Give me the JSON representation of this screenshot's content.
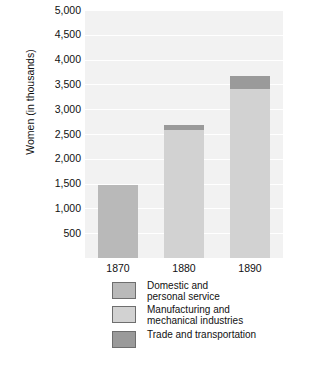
{
  "chart_data": {
    "type": "bar",
    "subtype": "stacked-vertical",
    "title": "",
    "xlabel": "",
    "ylabel": "Women (in thousands)",
    "categories": [
      "1870",
      "1880",
      "1890"
    ],
    "series": [
      {
        "name": "Domestic and\npersonal service",
        "color": "#b9b9b9",
        "values": [
          1480,
          0,
          0
        ]
      },
      {
        "name": "Manufacturing and\nmechanical industries",
        "color": "#d2d2d2",
        "values": [
          0,
          2590,
          3400
        ]
      },
      {
        "name": "Trade and transportation",
        "color": "#9a9a9a",
        "values": [
          0,
          90,
          280
        ]
      }
    ],
    "totals": [
      1480,
      2680,
      3680
    ],
    "ylim": [
      0,
      5000
    ],
    "ytick_values": [
      500,
      1000,
      1500,
      2000,
      2500,
      3000,
      3500,
      4000,
      4500,
      5000
    ],
    "ytick_labels": [
      "500",
      "1,000",
      "1,500",
      "2,000",
      "2,500",
      "3,000",
      "3,500",
      "4,000",
      "4,500",
      "5,000"
    ],
    "grid": true,
    "grid_color": "#ffffff",
    "plot_background": "#f2f2f2",
    "legend_position": "bottom"
  },
  "axes": {
    "y_title": "Women (in thousands)"
  },
  "legend": {
    "items": [
      {
        "label": "Domestic and\npersonal service",
        "color": "#b9b9b9"
      },
      {
        "label": "Manufacturing and\nmechanical industries",
        "color": "#d2d2d2"
      },
      {
        "label": "Trade and transportation",
        "color": "#9a9a9a"
      }
    ]
  }
}
